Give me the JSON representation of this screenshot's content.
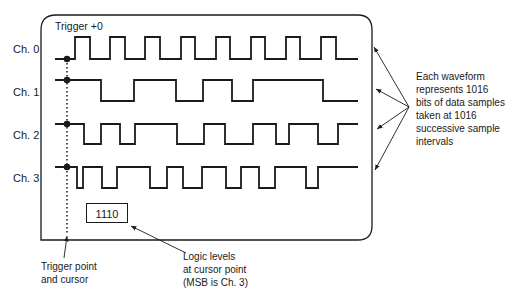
{
  "display": {
    "trigger_label": "Trigger +0",
    "readout_value": "1110"
  },
  "channels": [
    {
      "label": "Ch. 0",
      "high_y": 37,
      "low_y": 59,
      "start_level": "low",
      "transitions_x": [
        75,
        90,
        110,
        125,
        145,
        160,
        181,
        195,
        216,
        230,
        251,
        265,
        286,
        300,
        321,
        336
      ]
    },
    {
      "label": "Ch. 1",
      "high_y": 80,
      "low_y": 101,
      "start_level": "high",
      "transitions_x": [
        101,
        134,
        176,
        203,
        232,
        253,
        323
      ]
    },
    {
      "label": "Ch. 2",
      "high_y": 124,
      "low_y": 144,
      "start_level": "high",
      "transitions_x": [
        84,
        101,
        120,
        135,
        177,
        204,
        225,
        253,
        276,
        289,
        318,
        338
      ]
    },
    {
      "label": "Ch. 3",
      "high_y": 167,
      "low_y": 188,
      "start_level": "high",
      "transitions_x": [
        77,
        83,
        102,
        117,
        150,
        167,
        183,
        202,
        226,
        241,
        259,
        275,
        306,
        318
      ]
    }
  ],
  "annotations": {
    "waveform_note": [
      "Each waveform",
      "represents 1016",
      "bits of data samples",
      "taken at 1016",
      "successive sample",
      "intervals"
    ],
    "trigger_note": [
      "Trigger point",
      "and cursor"
    ],
    "logic_note": [
      "Logic levels",
      "at cursor point",
      "(MSB is Ch. 3)"
    ]
  },
  "colors": {
    "ink": "#1a1a1a",
    "background": "#ffffff"
  }
}
